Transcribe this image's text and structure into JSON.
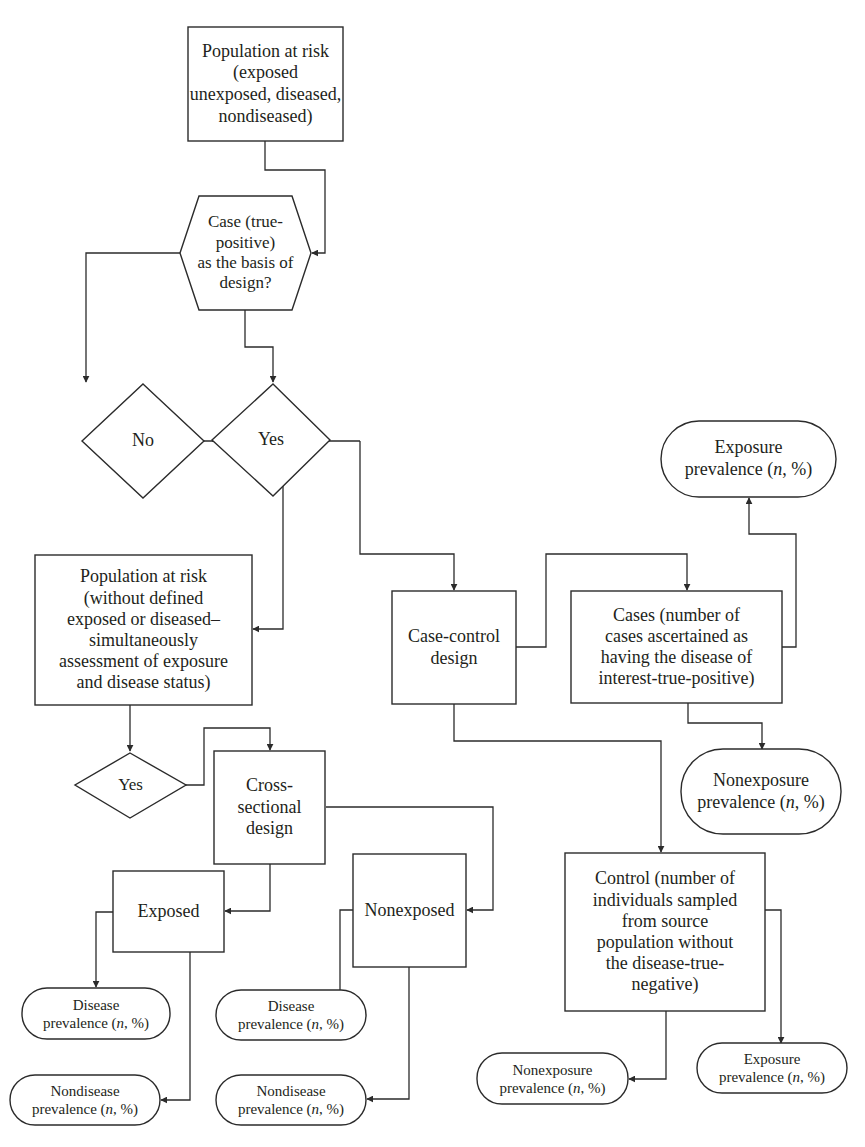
{
  "diagram": {
    "type": "flowchart",
    "colors": {
      "stroke": "#2b2b2b",
      "text": "#231f20",
      "background": "#ffffff"
    },
    "nodes": {
      "population_top": {
        "shape": "rectangle",
        "label": "Population at risk (exposed\nunexposed, diseased,\nnondiseased)"
      },
      "case_decision": {
        "shape": "hexagon",
        "label": "Case (true-positive)\nas the basis of\ndesign?"
      },
      "no_decision": {
        "shape": "diamond",
        "label": "No"
      },
      "yes_decision_case": {
        "shape": "diamond",
        "label": "Yes"
      },
      "population_undefined": {
        "shape": "rectangle",
        "label": "Population at risk\n(without defined\nexposed or diseased–\nsimultaneously\nassessment of exposure\nand disease status)"
      },
      "case_control_design": {
        "shape": "rectangle",
        "label": "Case-control\ndesign"
      },
      "cases": {
        "shape": "rectangle",
        "label": "Cases (number of\ncases ascertained as\nhaving the disease of\ninterest-true-positive)"
      },
      "cases_exposure_prevalence": {
        "shape": "terminator",
        "label_main": "Exposure\nprevalence (",
        "label_n": "n",
        "label_tail": ", %)"
      },
      "cases_nonexposure_prevalence": {
        "shape": "terminator",
        "label_main": "Nonexposure\nprevalence (",
        "label_n": "n",
        "label_tail": ", %)"
      },
      "yes_decision_cross": {
        "shape": "diamond",
        "label": "Yes"
      },
      "cross_sectional_design": {
        "shape": "rectangle",
        "label": "Cross-\nsectional\ndesign"
      },
      "exposed": {
        "shape": "rectangle",
        "label": "Exposed"
      },
      "nonexposed": {
        "shape": "rectangle",
        "label": "Nonexposed"
      },
      "control": {
        "shape": "rectangle",
        "label": "Control (number of\nindividuals sampled\nfrom source\npopulation without\nthe disease-true-\nnegative)"
      },
      "exposed_disease_prevalence": {
        "shape": "terminator",
        "label_main": "Disease\nprevalence (",
        "label_n": "n",
        "label_tail": ", %)"
      },
      "exposed_nondisease_prevalence": {
        "shape": "terminator",
        "label_main": "Nondisease\nprevalence (",
        "label_n": "n",
        "label_tail": ", %)"
      },
      "nonexposed_disease_prevalence": {
        "shape": "terminator",
        "label_main": "Disease\nprevalence (",
        "label_n": "n",
        "label_tail": ", %)"
      },
      "nonexposed_nondisease_prevalence": {
        "shape": "terminator",
        "label_main": "Nondisease\nprevalence (",
        "label_n": "n",
        "label_tail": ", %)"
      },
      "control_nonexposure_prevalence": {
        "shape": "terminator",
        "label_main": "Nonexposure\nprevalence (",
        "label_n": "n",
        "label_tail": ", %)"
      },
      "control_exposure_prevalence": {
        "shape": "terminator",
        "label_main": "Exposure\nprevalence (",
        "label_n": "n",
        "label_tail": ", %)"
      }
    },
    "edges": [
      {
        "from": "population_top",
        "to": "case_decision"
      },
      {
        "from": "case_decision",
        "to": "no_decision"
      },
      {
        "from": "case_decision",
        "to": "yes_decision_case"
      },
      {
        "from": "no_decision",
        "to": "population_undefined"
      },
      {
        "from": "yes_decision_case",
        "to": "case_control_design"
      },
      {
        "from": "case_control_design",
        "to": "cases"
      },
      {
        "from": "case_control_design",
        "to": "control"
      },
      {
        "from": "cases",
        "to": "cases_exposure_prevalence"
      },
      {
        "from": "cases",
        "to": "cases_nonexposure_prevalence"
      },
      {
        "from": "population_undefined",
        "to": "yes_decision_cross"
      },
      {
        "from": "yes_decision_cross",
        "to": "cross_sectional_design"
      },
      {
        "from": "cross_sectional_design",
        "to": "exposed"
      },
      {
        "from": "cross_sectional_design",
        "to": "nonexposed"
      },
      {
        "from": "exposed",
        "to": "exposed_disease_prevalence"
      },
      {
        "from": "exposed",
        "to": "exposed_nondisease_prevalence"
      },
      {
        "from": "nonexposed",
        "to": "nonexposed_disease_prevalence"
      },
      {
        "from": "nonexposed",
        "to": "nonexposed_nondisease_prevalence"
      },
      {
        "from": "control",
        "to": "control_nonexposure_prevalence"
      },
      {
        "from": "control",
        "to": "control_exposure_prevalence"
      }
    ]
  }
}
